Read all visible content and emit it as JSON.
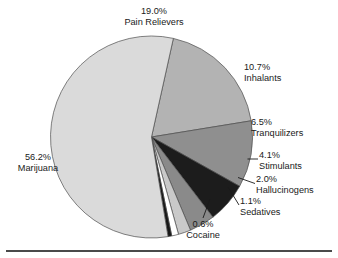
{
  "chart_data": {
    "type": "pie",
    "title": "",
    "subtitle": "",
    "xlabel": "",
    "ylabel": "",
    "legend_position": "callouts",
    "grid": false,
    "units": "percent",
    "total": 100.2,
    "categories": [
      "Pain Relievers",
      "Inhalants",
      "Tranquilizers",
      "Stimulants",
      "Hallucinogens",
      "Sedatives",
      "Cocaine",
      "Marijuana"
    ],
    "values": [
      19.0,
      10.7,
      6.5,
      4.1,
      2.0,
      1.1,
      0.6,
      56.2
    ],
    "slices": [
      {
        "name": "Pain Relievers",
        "value": 19.0,
        "pct_label": "19.0%",
        "color": "#b3b3b3",
        "label_align": "align-center",
        "label_left": 87,
        "label_top": 6,
        "label_width": 134,
        "leader": null
      },
      {
        "name": "Inhalants",
        "value": 10.7,
        "pct_label": "10.7%",
        "color": "#8f8f8f",
        "label_align": "align-left",
        "label_left": 244,
        "label_top": 62,
        "label_width": 92,
        "leader": null
      },
      {
        "name": "Tranquilizers",
        "value": 6.5,
        "pct_label": "6.5%",
        "color": "#1c1c1c",
        "label_align": "align-left",
        "label_left": 251,
        "label_top": 117,
        "label_width": 86,
        "leader": null
      },
      {
        "name": "Stimulants",
        "value": 4.1,
        "pct_label": "4.1%",
        "color": "#8a8a8a",
        "label_align": "align-left",
        "label_left": 259,
        "label_top": 150,
        "label_width": 78,
        "leader": [
          [
            247.5,
            159.0
          ],
          [
            258.0,
            159.0
          ]
        ]
      },
      {
        "name": "Hallucinogens",
        "value": 2.0,
        "pct_label": "2.0%",
        "color": "#c9c9c9",
        "label_align": "align-left",
        "label_left": 256,
        "label_top": 174,
        "label_width": 81,
        "leader": [
          [
            238.0,
            177.5
          ],
          [
            255.0,
            183.5
          ]
        ]
      },
      {
        "name": "Sedatives",
        "value": 1.1,
        "pct_label": "1.1%",
        "color": "#ffffff",
        "label_align": "align-left",
        "label_left": 240,
        "label_top": 196,
        "label_width": 78,
        "leader": [
          [
            228.0,
            187.0
          ],
          [
            239.0,
            205.0
          ]
        ]
      },
      {
        "name": "Cocaine",
        "value": 0.6,
        "pct_label": "0.6%",
        "color": "#171717",
        "label_align": "align-center",
        "label_left": 172,
        "label_top": 219,
        "label_width": 62,
        "leader": [
          [
            210.0,
            199.0
          ],
          [
            203.0,
            218.0
          ]
        ]
      },
      {
        "name": "Marijuana",
        "value": 56.2,
        "pct_label": "56.2%",
        "color": "#dadada",
        "label_align": "align-center",
        "label_left": 3,
        "label_top": 152,
        "label_width": 70,
        "leader": null
      }
    ],
    "geometry": {
      "center_x": 151.5,
      "center_y": 137.0,
      "radius": 101.0,
      "start_angle_deg": -77.5
    }
  }
}
